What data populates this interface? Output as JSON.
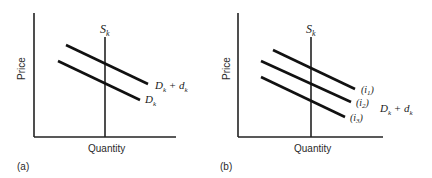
{
  "figure": {
    "panels": [
      {
        "id": "a",
        "caption": "(a)",
        "y_axis_label": "Price",
        "x_axis_label": "Quantity",
        "supply_label": "S",
        "supply_sub": "k",
        "curves": [
          {
            "label_main": "D",
            "label_sub": "k",
            "label_plus": " + d",
            "label_sub2": "k"
          },
          {
            "label_main": "D",
            "label_sub": "k"
          }
        ]
      },
      {
        "id": "b",
        "caption": "(b)",
        "y_axis_label": "Price",
        "x_axis_label": "Quantity",
        "supply_label": "S",
        "supply_sub": "k",
        "curves": [
          {
            "label_open": "(i",
            "label_sub": "1",
            "label_close": ")"
          },
          {
            "label_open": "(i",
            "label_sub": "2",
            "label_close": ")"
          },
          {
            "label_open": "(i",
            "label_sub": "3",
            "label_close": ")"
          }
        ],
        "group_label_main": "D",
        "group_label_sub": "k",
        "group_label_plus": " + d",
        "group_label_sub2": "k"
      }
    ]
  }
}
